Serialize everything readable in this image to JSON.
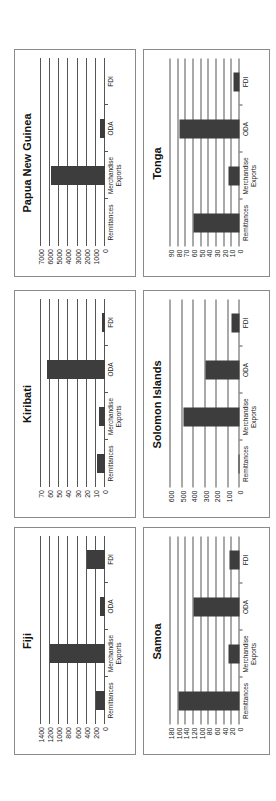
{
  "page": {
    "orientation": "rotated-90-ccw",
    "bar_color": "#3d3d3d",
    "gridline_color": "#555555",
    "border_color": "#8a8a8a"
  },
  "categories": [
    "Remittances",
    "Merchandise Exports",
    "ODA",
    "FDI"
  ],
  "category_labels": [
    {
      "line1": "Remittances",
      "line2": ""
    },
    {
      "line1": "Merchandise",
      "line2": "Exports"
    },
    {
      "line1": "ODA",
      "line2": ""
    },
    {
      "line1": "FDI",
      "line2": ""
    }
  ],
  "chart_data": [
    {
      "type": "bar",
      "title": "Papua New Guinea",
      "categories": [
        "Remittances",
        "Merchandise Exports",
        "ODA",
        "FDI"
      ],
      "values": [
        0,
        5900,
        500,
        0
      ],
      "ylim": [
        0,
        7000
      ],
      "yticks": [
        "0",
        "1000",
        "2000",
        "3000",
        "4000",
        "5000",
        "6000",
        "7000"
      ],
      "xlabel": "",
      "ylabel": "",
      "grid": true,
      "legend": null
    },
    {
      "type": "bar",
      "title": "Tonga",
      "categories": [
        "Remittances",
        "Merchandise Exports",
        "ODA",
        "FDI"
      ],
      "values": [
        60,
        15,
        78,
        8
      ],
      "ylim": [
        0,
        90
      ],
      "yticks": [
        "0",
        "10",
        "20",
        "30",
        "40",
        "50",
        "60",
        "70",
        "80",
        "90"
      ],
      "xlabel": "",
      "ylabel": "",
      "grid": true,
      "legend": null
    },
    {
      "type": "bar",
      "title": "Kiribati",
      "categories": [
        "Remittances",
        "Merchandise Exports",
        "ODA",
        "FDI"
      ],
      "values": [
        9,
        7,
        64,
        3
      ],
      "ylim": [
        0,
        70
      ],
      "yticks": [
        "0",
        "10",
        "20",
        "30",
        "40",
        "50",
        "60",
        "70"
      ],
      "xlabel": "",
      "ylabel": "",
      "grid": true,
      "legend": null
    },
    {
      "type": "bar",
      "title": "Solomon Islands",
      "categories": [
        "Remittances",
        "Merchandise Exports",
        "ODA",
        "FDI"
      ],
      "values": [
        5,
        490,
        300,
        70
      ],
      "ylim": [
        0,
        600
      ],
      "yticks": [
        "0",
        "100",
        "200",
        "300",
        "400",
        "500",
        "600"
      ],
      "xlabel": "",
      "ylabel": "",
      "grid": true,
      "legend": null
    },
    {
      "type": "bar",
      "title": "Fiji",
      "categories": [
        "Remittances",
        "Merchandise Exports",
        "ODA",
        "FDI"
      ],
      "values": [
        200,
        1200,
        100,
        400
      ],
      "ylim": [
        0,
        1400
      ],
      "yticks": [
        "0",
        "200",
        "400",
        "600",
        "800",
        "1000",
        "1200",
        "1400"
      ],
      "xlabel": "",
      "ylabel": "",
      "grid": true,
      "legend": null
    },
    {
      "type": "bar",
      "title": "Samoa",
      "categories": [
        "Remittances",
        "Merchandise Exports",
        "ODA",
        "FDI"
      ],
      "values": [
        160,
        30,
        120,
        25
      ],
      "ylim": [
        0,
        180
      ],
      "yticks": [
        "0",
        "20",
        "40",
        "60",
        "80",
        "100",
        "120",
        "140",
        "160",
        "180"
      ],
      "xlabel": "",
      "ylabel": "",
      "grid": true,
      "legend": null
    }
  ],
  "layout": [
    {
      "left": 14,
      "top": 49,
      "width": 122,
      "height": 228
    },
    {
      "left": 143,
      "top": 49,
      "width": 127,
      "height": 228
    },
    {
      "left": 14,
      "top": 290,
      "width": 122,
      "height": 228
    },
    {
      "left": 143,
      "top": 290,
      "width": 127,
      "height": 228
    },
    {
      "left": 14,
      "top": 527,
      "width": 122,
      "height": 228
    },
    {
      "left": 143,
      "top": 527,
      "width": 127,
      "height": 228
    }
  ]
}
